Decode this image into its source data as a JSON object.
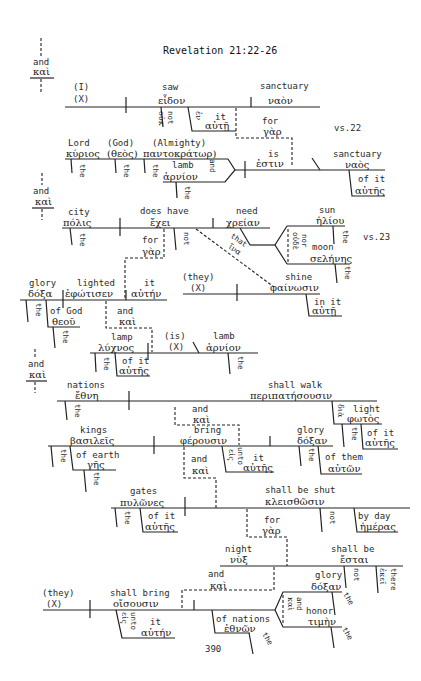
{
  "title": "Revelation 21:22-26",
  "page_number": "390",
  "verse_labels": {
    "vs22": "vs.22",
    "vs23": "vs.23"
  },
  "conj_top": {
    "en": "and",
    "gr": "καὶ"
  },
  "conj_mid": {
    "en": "and",
    "gr": "καὶ"
  },
  "conj_lower": {
    "en": "and",
    "gr": "καὶ"
  },
  "clause1": {
    "subject": {
      "en": "(I)",
      "gr": "(X)"
    },
    "verb": {
      "en": "saw",
      "gr": "εἶδον"
    },
    "object": {
      "en": "sanctuary",
      "gr": "ναὸν"
    },
    "neg": {
      "en": "not",
      "gr": "οὐκ"
    },
    "prep": {
      "en": "in",
      "gr": "ἐν",
      "obj_en": "it",
      "obj_gr": "αὐτῇ"
    },
    "conj": {
      "en": "for",
      "gr": "γὰρ"
    }
  },
  "clause2": {
    "subj1": {
      "en": "Lord",
      "gr": "κύριος",
      "art": "the",
      "art_gr": "ὁ"
    },
    "subj2": {
      "en": "(God)",
      "gr": "(θεὸς)",
      "art": "the",
      "art_gr": "ὁ"
    },
    "subj3": {
      "en": "(Almighty)",
      "gr": "παντοκράτωρ)",
      "art": "the",
      "art_gr": "ὁ"
    },
    "subj4": {
      "en": "lamb",
      "gr": "ἀρνίον",
      "art": "the",
      "art_gr": "τὸ"
    },
    "conj": {
      "en": "and",
      "gr": "καὶ"
    },
    "verb": {
      "en": "is",
      "gr": "ἐστιν"
    },
    "predicate": {
      "en": "sanctuary",
      "gr": "ναὸς"
    },
    "mod": {
      "en": "of it",
      "gr": "αὐτῆς"
    }
  },
  "clause3": {
    "subject": {
      "en": "city",
      "gr": "πόλις",
      "art": "the",
      "art_gr": "ἡ"
    },
    "verb": {
      "en": "does have",
      "gr": "ἔχει"
    },
    "object": {
      "en": "need",
      "gr": "χρείαν"
    },
    "neg": {
      "en": "not",
      "gr": "οὐ"
    },
    "that": {
      "en": "that",
      "gr": "ἵνα"
    },
    "nor": {
      "en": "nor",
      "gr": "οὐδὲ"
    },
    "sun": {
      "en": "sun",
      "gr": "ἡλίου",
      "art": "the",
      "art_gr": "τοῦ"
    },
    "moon": {
      "en": "moon",
      "gr": "σελήνης",
      "art": "the",
      "art_gr": "τῆς"
    },
    "conj": {
      "en": "for",
      "gr": "γὰρ"
    },
    "sub_subject": {
      "en": "(they)",
      "gr": "(X)"
    },
    "sub_verb": {
      "en": "shine",
      "gr": "φαίνωσιν"
    },
    "sub_mod": {
      "en": "in it",
      "gr": "αὐτῇ"
    }
  },
  "clause4": {
    "subject": {
      "en": "glory",
      "gr": "δόξα",
      "art": "the",
      "art_gr": "ἡ"
    },
    "verb": {
      "en": "lighted",
      "gr": "ἐφώτισεν"
    },
    "object": {
      "en": "it",
      "gr": "αὐτήν"
    },
    "mod": {
      "en": "of God",
      "gr": "θεοῦ",
      "art": "the",
      "art_gr": "τοῦ"
    },
    "conj": {
      "en": "and",
      "gr": "καὶ"
    }
  },
  "clause5": {
    "subject": {
      "en": "lamp",
      "gr": "λύχνος",
      "art": "the",
      "art_gr": "ὁ"
    },
    "mod": {
      "en": "of it",
      "gr": "αὐτῆς"
    },
    "verb": {
      "en": "(is)",
      "gr": "(X)"
    },
    "predicate": {
      "en": "lamb",
      "gr": "ἀρνίον",
      "art": "the",
      "art_gr": "τὸ"
    }
  },
  "clause6": {
    "subject": {
      "en": "nations",
      "gr": "ἔθνη",
      "art": "the",
      "art_gr": "τὰ"
    },
    "verb": {
      "en": "shall walk",
      "gr": "περιπατήσουσιν"
    },
    "prep": {
      "en": "by",
      "gr": "διὰ",
      "obj_en": "light",
      "obj_gr": "φωτὸς",
      "art": "the",
      "art_gr": "τοῦ"
    },
    "mod": {
      "en": "of it",
      "gr": "αὐτῆς"
    },
    "conj": {
      "en": "and",
      "gr": "καὶ"
    }
  },
  "clause7": {
    "subject": {
      "en": "kings",
      "gr": "βασιλεῖς",
      "art": "the",
      "art_gr": "οἱ"
    },
    "mod": {
      "en": "of earth",
      "gr": "γῆς",
      "art": "the",
      "art_gr": "τῆς"
    },
    "verb": {
      "en": "bring",
      "gr": "φέρουσιν"
    },
    "object": {
      "en": "glory",
      "gr": "δόξαν",
      "art": "the",
      "art_gr": "τὴν"
    },
    "obj_mod": {
      "en": "of them",
      "gr": "αὐτῶν"
    },
    "prep": {
      "en": "unto",
      "gr": "εἰς",
      "obj_en": "it",
      "obj_gr": "αὐτῆς"
    },
    "conj": {
      "en": "and",
      "gr": "καὶ"
    }
  },
  "clause8": {
    "subject": {
      "en": "gates",
      "gr": "πυλῶνες",
      "art": "the",
      "art_gr": "οἱ"
    },
    "mod": {
      "en": "of it",
      "gr": "αὐτῆς"
    },
    "verb": {
      "en": "shall be shut",
      "gr": "κλεισθῶσιν"
    },
    "neg": {
      "en": "not",
      "gr": "οὐ μὴ"
    },
    "time": {
      "en": "by day",
      "gr": "ἡμέρας"
    },
    "conj": {
      "en": "for",
      "gr": "γὰρ"
    }
  },
  "clause9": {
    "subject": {
      "en": "night",
      "gr": "νὺξ"
    },
    "verb": {
      "en": "shall be",
      "gr": "ἔσται"
    },
    "neg": {
      "en": "not",
      "gr": "οὐκ"
    },
    "adv": {
      "en": "there",
      "gr": "ἐκεῖ"
    },
    "conj": {
      "en": "and",
      "gr": "καὶ"
    }
  },
  "clause10": {
    "subject": {
      "en": "(they)",
      "gr": "(X)"
    },
    "verb": {
      "en": "shall bring",
      "gr": "οἴσουσιν"
    },
    "prep": {
      "en": "unto",
      "gr": "εἰς",
      "obj_en": "it",
      "obj_gr": "αὐτήν"
    },
    "obj1": {
      "en": "glory",
      "gr": "δόξαν",
      "art": "the",
      "art_gr": "τὴν"
    },
    "obj2": {
      "en": "honor",
      "gr": "τιμὴν",
      "art": "the",
      "art_gr": "τὴν"
    },
    "obj_conj": {
      "en": "and",
      "gr": "καὶ"
    },
    "mod": {
      "en": "of nations",
      "gr": "ἐθνῶν",
      "art": "the",
      "art_gr": "τῶν"
    }
  }
}
